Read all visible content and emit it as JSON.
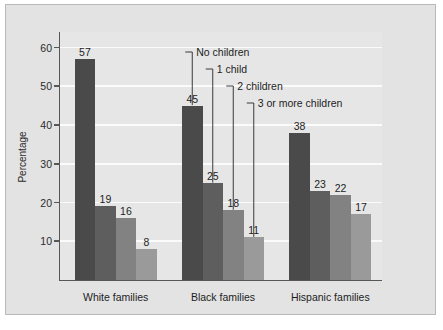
{
  "chart_data": {
    "type": "bar",
    "title": "",
    "xlabel": "",
    "ylabel": "Percentage",
    "ylim": [
      0,
      64
    ],
    "yticks": [
      10,
      20,
      30,
      40,
      50,
      60
    ],
    "grid": true,
    "legend_position": "annotations",
    "categories": [
      "White families",
      "Black families",
      "Hispanic families"
    ],
    "series": [
      {
        "name": "No children",
        "color": "#4a4a4a",
        "values": [
          57,
          45,
          38
        ]
      },
      {
        "name": "1 child",
        "color": "#5e5e5e",
        "values": [
          19,
          25,
          23
        ]
      },
      {
        "name": "2 children",
        "color": "#828282",
        "values": [
          16,
          18,
          22
        ]
      },
      {
        "name": "3 or more children",
        "color": "#9a9a9a",
        "values": [
          8,
          11,
          17
        ]
      }
    ],
    "annotations": [
      {
        "label": "No children",
        "target_group": "Black families",
        "target_value": 45
      },
      {
        "label": "1 child",
        "target_group": "Black families",
        "target_value": 25
      },
      {
        "label": "2 children",
        "target_group": "Black families",
        "target_value": 18
      },
      {
        "label": "3 or more children",
        "target_group": "Black families",
        "target_value": 11
      }
    ]
  },
  "colors": {
    "figure_background": "#e3e3e3",
    "plot_background": "#e6e6e6",
    "gridline": "#fbfbfb",
    "axis": "#575757",
    "text": "#1d1d1d",
    "leader_line": "#3a3a3a"
  }
}
